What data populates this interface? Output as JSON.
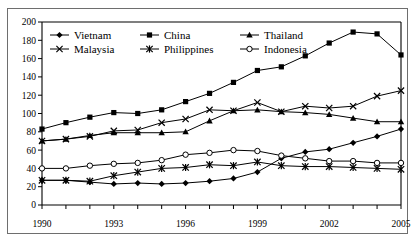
{
  "chart_data": {
    "type": "line",
    "title": "",
    "subtitle": "",
    "xlabel": "",
    "ylabel": "",
    "x": [
      1990,
      1991,
      1992,
      1993,
      1994,
      1995,
      1996,
      1997,
      1998,
      1999,
      2000,
      2001,
      2002,
      2003,
      2004,
      2005
    ],
    "xlim": [
      1990,
      2005
    ],
    "ylim": [
      0,
      200
    ],
    "ytick_step": 20,
    "xtick_labels": [
      "1990",
      "1993",
      "1996",
      "1999",
      "2002",
      "2005"
    ],
    "xtick_values": [
      1990,
      1993,
      1996,
      1999,
      2002,
      2005
    ],
    "ytick_labels": [
      "0",
      "20",
      "40",
      "60",
      "80",
      "100",
      "120",
      "140",
      "160",
      "180",
      "200"
    ],
    "grid": false,
    "legend_position": "top-left-inside",
    "series": [
      {
        "name": "Vietnam",
        "marker": "filled-diamond",
        "color": "#000000",
        "values": [
          27,
          27,
          25,
          23,
          24,
          23,
          24,
          26,
          29,
          36,
          51,
          58,
          61,
          68,
          75,
          83
        ]
      },
      {
        "name": "China",
        "marker": "filled-square",
        "color": "#000000",
        "values": [
          83,
          90,
          96,
          101,
          100,
          104,
          113,
          122,
          134,
          147,
          151,
          163,
          177,
          189,
          187,
          164
        ]
      },
      {
        "name": "Thailand",
        "marker": "filled-triangle",
        "color": "#000000",
        "values": [
          70,
          72,
          76,
          79,
          79,
          79,
          80,
          92,
          103,
          104,
          102,
          101,
          99,
          95,
          91,
          91
        ]
      },
      {
        "name": "Malaysia",
        "marker": "cross-x",
        "color": "#000000",
        "values": [
          70,
          72,
          75,
          81,
          82,
          90,
          94,
          104,
          103,
          112,
          102,
          108,
          106,
          108,
          119,
          125
        ]
      },
      {
        "name": "Philippines",
        "marker": "asterisk",
        "color": "#000000",
        "values": [
          27,
          27,
          26,
          32,
          36,
          40,
          41,
          44,
          43,
          47,
          43,
          42,
          42,
          41,
          40,
          39
        ]
      },
      {
        "name": "Indonesia",
        "marker": "open-circle",
        "color": "#000000",
        "values": [
          40,
          40,
          43,
          45,
          46,
          49,
          55,
          57,
          60,
          59,
          54,
          51,
          48,
          48,
          46,
          46
        ]
      }
    ]
  },
  "legend": {
    "entries": [
      {
        "label": "Vietnam",
        "marker": "filled-diamond"
      },
      {
        "label": "China",
        "marker": "filled-square"
      },
      {
        "label": "Thailand",
        "marker": "filled-triangle"
      },
      {
        "label": "Malaysia",
        "marker": "cross-x"
      },
      {
        "label": "Philippines",
        "marker": "asterisk"
      },
      {
        "label": "Indonesia",
        "marker": "open-circle"
      }
    ]
  },
  "axes": {
    "y_ticks": [
      "200",
      "180",
      "160",
      "140",
      "120",
      "100",
      "80",
      "60",
      "40",
      "20",
      "0"
    ],
    "x_ticks": [
      "1990",
      "1993",
      "1996",
      "1999",
      "2002",
      "2005"
    ]
  },
  "colors": {
    "line": "#000000",
    "frame": "#6e6e6e",
    "background": "#ffffff"
  }
}
